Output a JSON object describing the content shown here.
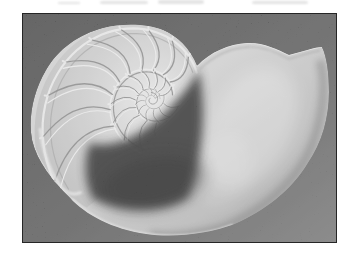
{
  "figure": {
    "media": "black-and-white halftone photograph on white page",
    "scan_artifacts": "faint remnants of cropped print along the top white margin"
  },
  "photo": {
    "alt": "Halftone photograph of a chambered nautilus shell cut in cross-section, showing the spiral chambers and large outer body chamber on a dark mottled background"
  },
  "palette": {
    "page_bg": "#ffffff",
    "photo_bg_dark": "#2e2e2e",
    "photo_bg_mid": "#484848",
    "photo_bg_light": "#6e6e6e",
    "shell_bright": "#f0f0f0",
    "shell_light": "#d8d8d8",
    "shell_base": "#c6c6c6",
    "body_top": "#dadada",
    "body_mid": "#c2c2c2",
    "body_rim": "#9d9d9d",
    "septa_shadow": "#898989",
    "septa_ridge": "#f4f4f4",
    "wall_bright": "#f1f1f1",
    "wall_shadow": "#a6a6a6",
    "aperture_shadow": "#383838",
    "aperture_core": "#2f2f2f",
    "rim_highlight": "#ececec",
    "photo_border": "#262626"
  }
}
